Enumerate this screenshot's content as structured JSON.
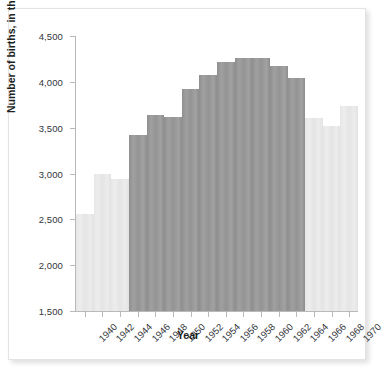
{
  "chart_data": {
    "type": "bar",
    "title": "",
    "xlabel": "Year",
    "ylabel": "Number of births, in thousands",
    "ylim": [
      1500,
      4500
    ],
    "ytick_labels": [
      "1,500",
      "2,000",
      "2,500",
      "3,000",
      "3,500",
      "4,000",
      "4,500"
    ],
    "yticks": [
      1500,
      2000,
      2500,
      3000,
      3500,
      4000,
      4500
    ],
    "grid": false,
    "legend": "none",
    "categories": [
      "1940",
      "1941",
      "1942",
      "1943",
      "1944",
      "1945",
      "1946",
      "1947",
      "1948",
      "1949",
      "1950",
      "1951",
      "1952",
      "1953",
      "1954",
      "1955",
      "1956",
      "1957",
      "1958",
      "1959",
      "1960",
      "1961",
      "1962",
      "1963",
      "1964",
      "1965",
      "1966",
      "1967",
      "1968",
      "1969",
      "1970"
    ],
    "xtick_labels": [
      "1940",
      "1942",
      "1944",
      "1946",
      "1948",
      "1950",
      "1952",
      "1954",
      "1956",
      "1958",
      "1960",
      "1962",
      "1964",
      "1966",
      "1968",
      "1970"
    ],
    "bars": [
      {
        "x": "1940",
        "value": 2560,
        "group": "pre-boom"
      },
      {
        "x": "1942",
        "value": 2990,
        "group": "pre-boom"
      },
      {
        "x": "1944",
        "value": 2940,
        "group": "pre-boom"
      },
      {
        "x": "1946",
        "value": 3420,
        "group": "baby-boom"
      },
      {
        "x": "1948",
        "value": 3640,
        "group": "baby-boom"
      },
      {
        "x": "1950",
        "value": 3620,
        "group": "baby-boom"
      },
      {
        "x": "1952",
        "value": 3920,
        "group": "baby-boom"
      },
      {
        "x": "1954",
        "value": 4080,
        "group": "baby-boom"
      },
      {
        "x": "1956",
        "value": 4220,
        "group": "baby-boom"
      },
      {
        "x": "1958",
        "value": 4260,
        "group": "baby-boom"
      },
      {
        "x": "1960",
        "value": 4260,
        "group": "baby-boom"
      },
      {
        "x": "1962",
        "value": 4170,
        "group": "baby-boom"
      },
      {
        "x": "1964",
        "value": 4040,
        "group": "baby-boom"
      },
      {
        "x": "1966",
        "value": 3610,
        "group": "post-boom"
      },
      {
        "x": "1968",
        "value": 3520,
        "group": "post-boom"
      },
      {
        "x": "1970",
        "value": 3740,
        "group": "post-boom"
      }
    ],
    "colors": {
      "baby_boom_bar": "#969696",
      "other_bar": "#e7e7e7",
      "axis": "#b9b9b9",
      "text": "#33363b",
      "card_background": "#ffffff"
    }
  }
}
